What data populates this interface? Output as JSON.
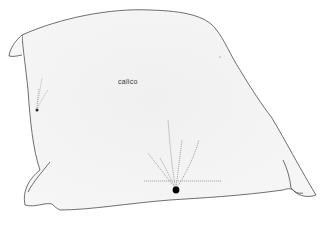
{
  "diagram": {
    "label": "calico",
    "colors": {
      "outline": "#4a4a4a",
      "fabric": "#f2f2f2",
      "stress": "#8a8a8a",
      "pin": "#000000"
    }
  }
}
